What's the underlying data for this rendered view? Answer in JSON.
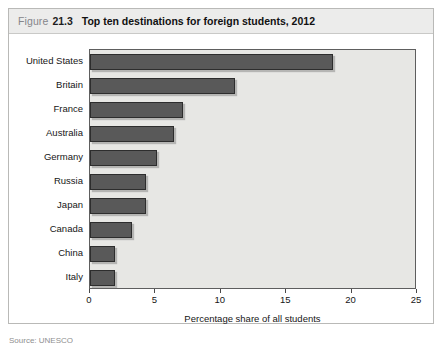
{
  "figure": {
    "label": "Figure",
    "number": "21.3",
    "title": "Top ten destinations for foreign students, 2012",
    "source_note": "Source: UNESCO"
  },
  "chart_data": {
    "type": "bar",
    "orientation": "horizontal",
    "title": "Top ten destinations for foreign students, 2012",
    "xlabel": "Percentage share of all students",
    "ylabel": "",
    "xlim": [
      0,
      25
    ],
    "xticks": [
      0,
      5,
      10,
      15,
      20,
      25
    ],
    "xtick_labels": [
      "0",
      "5",
      "10",
      "15",
      "20",
      "25"
    ],
    "grid": false,
    "legend": null,
    "categories": [
      "United States",
      "Britain",
      "France",
      "Australia",
      "Germany",
      "Russia",
      "Japan",
      "Canada",
      "China",
      "Italy"
    ],
    "values": [
      18.6,
      11.1,
      7.1,
      6.4,
      5.1,
      4.3,
      4.3,
      3.2,
      1.9,
      1.9
    ],
    "bar_color": "#595959",
    "bar_edge_color": "#2d2d2d",
    "plot_background": "#e7e7e4"
  }
}
